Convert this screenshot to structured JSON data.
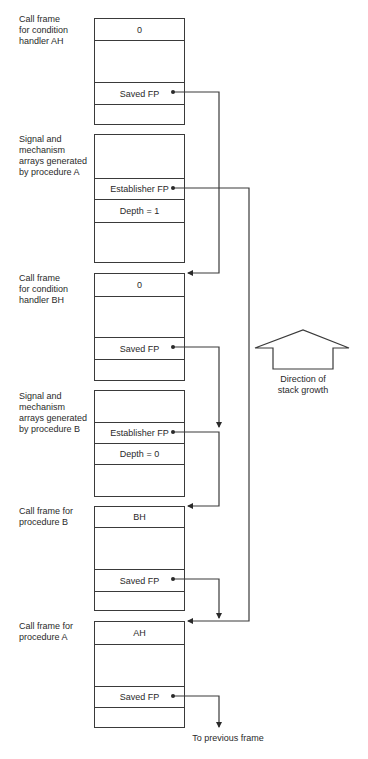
{
  "frames": [
    {
      "label": "Call frame\nfor condition\nhandler AH",
      "cells": {
        "top": "0",
        "saved_fp": "Saved FP"
      }
    },
    {
      "label": "Signal and\nmechanism\narrays generated\nby procedure A",
      "cells": {
        "establisher_fp": "Establisher FP",
        "depth": "Depth = 1"
      }
    },
    {
      "label": "Call frame\nfor condition\nhandler BH",
      "cells": {
        "top": "0",
        "saved_fp": "Saved FP"
      }
    },
    {
      "label": "Signal and\nmechanism\narrays generated\nby procedure B",
      "cells": {
        "establisher_fp": "Establisher FP",
        "depth": "Depth = 0"
      }
    },
    {
      "label": "Call frame for\nprocedure B",
      "cells": {
        "top": "BH",
        "saved_fp": "Saved FP"
      }
    },
    {
      "label": "Call frame for\nprocedure A",
      "cells": {
        "top": "AH",
        "saved_fp": "Saved FP"
      }
    }
  ],
  "stack_growth": {
    "caption": "Direction of\nstack growth",
    "icon": "up-arrow-icon"
  },
  "footer": {
    "to_previous": "To previous frame"
  },
  "colors": {
    "line": "#3a3a3a",
    "text": "#2a2a2a",
    "background": "#ffffff"
  }
}
